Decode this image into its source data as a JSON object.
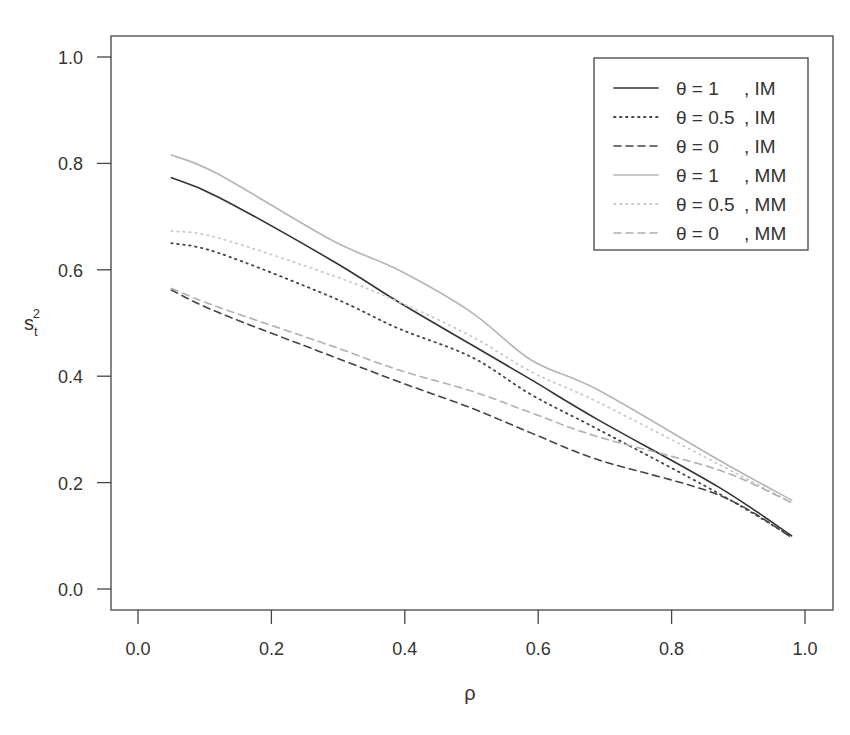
{
  "chart_data": {
    "type": "line",
    "title": "",
    "xlabel": "ρ",
    "ylabel": {
      "base": "s",
      "sub": "t",
      "sup": "2"
    },
    "xlim": [
      -0.04,
      1.04
    ],
    "ylim": [
      -0.04,
      1.04
    ],
    "xticks": [
      0.0,
      0.2,
      0.4,
      0.6,
      0.8,
      1.0
    ],
    "xtick_labels": [
      "0.0",
      "0.2",
      "0.4",
      "0.6",
      "0.8",
      "1.0"
    ],
    "yticks": [
      0.0,
      0.2,
      0.4,
      0.6,
      0.8,
      1.0
    ],
    "ytick_labels": [
      "0.0",
      "0.2",
      "0.4",
      "0.6",
      "0.8",
      "1.0"
    ],
    "grid": false,
    "legend_position": "top-right",
    "x": [
      0.05,
      0.12,
      0.29,
      0.39,
      0.5,
      0.59,
      0.69,
      0.87,
      0.98
    ],
    "series": [
      {
        "name": "θ = 1 , IM",
        "theta": "1",
        "method": "IM",
        "color": "#333333",
        "dash": "solid",
        "values": [
          0.773,
          0.737,
          0.618,
          0.54,
          0.459,
          0.393,
          0.318,
          0.192,
          0.1
        ]
      },
      {
        "name": "θ = 0.5 , IM",
        "theta": "0.5",
        "method": "IM",
        "color": "#444444",
        "dash": "dotted",
        "values": [
          0.65,
          0.632,
          0.549,
          0.49,
          0.436,
          0.365,
          0.3,
          0.18,
          0.098
        ]
      },
      {
        "name": "θ = 0 , IM",
        "theta": "0",
        "method": "IM",
        "color": "#444444",
        "dash": "dashed",
        "values": [
          0.562,
          0.52,
          0.438,
          0.39,
          0.34,
          0.293,
          0.243,
          0.177,
          0.097
        ]
      },
      {
        "name": "θ = 1 , MM",
        "theta": "1",
        "method": "MM",
        "color": "#b5b5b5",
        "dash": "solid",
        "values": [
          0.816,
          0.78,
          0.656,
          0.6,
          0.52,
          0.43,
          0.374,
          0.243,
          0.167
        ]
      },
      {
        "name": "θ = 0.5 , MM",
        "theta": "0.5",
        "method": "MM",
        "color": "#cccccc",
        "dash": "dotted",
        "values": [
          0.673,
          0.66,
          0.59,
          0.54,
          0.475,
          0.408,
          0.351,
          0.235,
          0.162
        ]
      },
      {
        "name": "θ = 0 , MM",
        "theta": "0",
        "method": "MM",
        "color": "#b0b0b0",
        "dash": "dashed",
        "values": [
          0.565,
          0.53,
          0.457,
          0.412,
          0.372,
          0.331,
          0.286,
          0.224,
          0.162
        ]
      }
    ]
  }
}
